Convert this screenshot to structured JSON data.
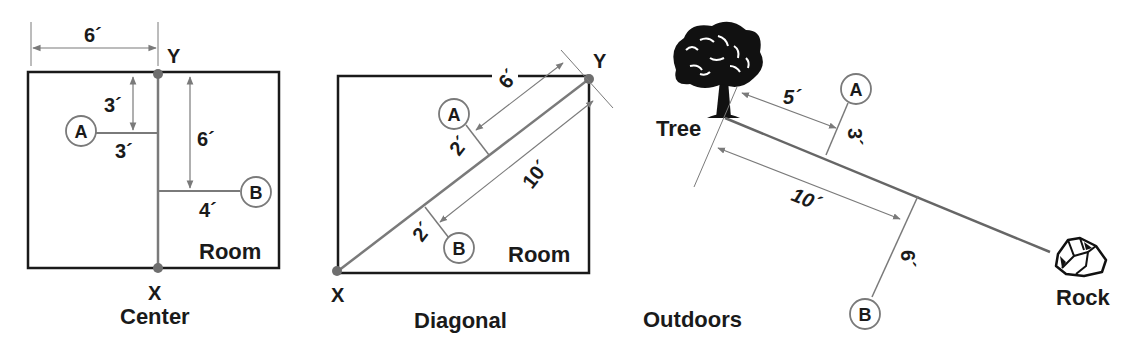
{
  "panels": {
    "center": {
      "caption": "Center",
      "room_label": "Room",
      "point_x": "X",
      "point_y": "Y",
      "marker_a": "A",
      "marker_b": "B",
      "dims": {
        "top_width": "6´",
        "a_down": "3´",
        "a_out": "3´",
        "b_down": "6´",
        "b_out": "4´"
      }
    },
    "diagonal": {
      "caption": "Diagonal",
      "room_label": "Room",
      "point_x": "X",
      "point_y": "Y",
      "marker_a": "A",
      "marker_b": "B",
      "dims": {
        "a_along": "6´",
        "a_out": "2´",
        "b_along": "10´",
        "b_out": "2´"
      }
    },
    "outdoors": {
      "caption": "Outdoors",
      "tree_label": "Tree",
      "rock_label": "Rock",
      "marker_a": "A",
      "marker_b": "B",
      "dims": {
        "a_along": "5´",
        "a_out": "3´",
        "b_along": "10´",
        "b_out": "6´"
      }
    }
  },
  "colors": {
    "ink": "#1a1a1a",
    "guide": "#7a7a7a",
    "point": "#6e6e6e"
  }
}
